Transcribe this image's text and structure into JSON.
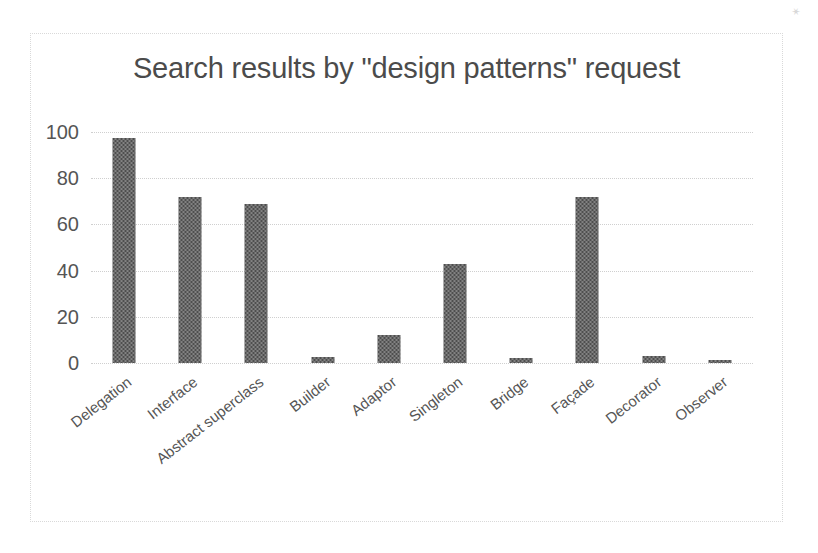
{
  "chart_data": {
    "type": "bar",
    "title": "Search results by \"design patterns\" request",
    "xlabel": "",
    "ylabel": "",
    "categories": [
      "Delegation",
      "Interface",
      "Abstract superclass",
      "Builder",
      "Adaptor",
      "Singleton",
      "Bridge",
      "Façade",
      "Decorator",
      "Observer"
    ],
    "values": [
      97.5,
      72,
      69,
      2.5,
      12,
      43,
      2,
      72,
      3,
      1.5
    ],
    "yticks": [
      0,
      20,
      40,
      60,
      80,
      100
    ],
    "ytick_labels": [
      "0",
      "20",
      "40",
      "60",
      "80",
      "100"
    ],
    "ylim": [
      0,
      100
    ],
    "grid": true,
    "grid_axis": "y",
    "legend": false,
    "legend_position": "none",
    "series": [
      {
        "name": "Search results",
        "values": [
          97.5,
          72,
          69,
          2.5,
          12,
          43,
          2,
          72,
          3,
          1.5
        ]
      }
    ],
    "colors": {
      "bar": "#4e4e4e",
      "grid": "#cfcfcf",
      "title_text": "#4b4b4b",
      "tick_text": "#555555",
      "frame_border": "#d9d9d9",
      "background": "#ffffff"
    }
  },
  "speckles": {
    "s1": "✶",
    "s2": "✹",
    "s3": "✸"
  }
}
